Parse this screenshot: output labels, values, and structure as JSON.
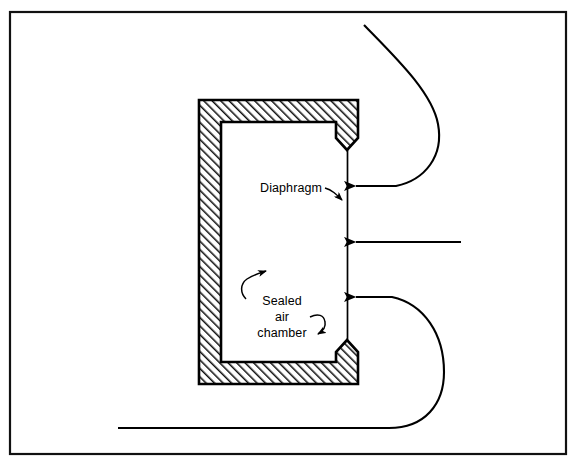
{
  "figure": {
    "background_color": "#ffffff",
    "line_color": "#000000",
    "hatch_color": "#1a1a1a",
    "border": {
      "name": "figure-border",
      "x": 9,
      "y": 11,
      "width": 557,
      "height": 443,
      "stroke_width": 2
    }
  },
  "labels": {
    "diaphragm": "Diaphragm",
    "sealed": "Sealed",
    "air": "air",
    "chamber": "chamber"
  },
  "components": {
    "chamber": {
      "name": "sealed-air-chamber-wall",
      "outer_left": 199,
      "outer_top": 100,
      "outer_right": 358,
      "outer_bottom": 384,
      "inner_left": 221,
      "inner_top": 122,
      "inner_right": 336,
      "inner_bottom": 362,
      "wall_thickness": 22,
      "tip_top_y": 150,
      "tip_bottom_y": 340
    },
    "diaphragm_line": {
      "name": "diaphragm-membrane",
      "x": 347,
      "y_top": 150,
      "y_bottom": 340
    }
  },
  "arrows": [
    {
      "name": "airflow-arrow-top-curved",
      "type": "curved",
      "direction": "left",
      "tip_x": 352,
      "tip_y": 186
    },
    {
      "name": "airflow-arrow-middle-straight",
      "type": "straight",
      "direction": "left",
      "tip_x": 352,
      "tip_y": 242,
      "tail_x": 461
    },
    {
      "name": "airflow-arrow-bottom-curved",
      "type": "curved",
      "direction": "left",
      "tip_x": 352,
      "tip_y": 297
    }
  ],
  "leaders": [
    {
      "name": "diaphragm-leader-arrow",
      "points_to": "diaphragm-membrane"
    },
    {
      "name": "sealed-chamber-leader-upper",
      "points_to": "chamber-interior"
    },
    {
      "name": "sealed-chamber-leader-lower",
      "points_to": "chamber-interior"
    }
  ]
}
